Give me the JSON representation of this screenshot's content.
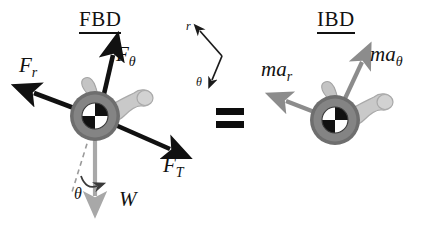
{
  "figure": {
    "type": "free-body-diagram",
    "background_color": "#ffffff",
    "width": 431,
    "height": 232,
    "equals_sign": "="
  },
  "panels": {
    "left": {
      "title": "FBD",
      "title_underlined": true,
      "body_label": "pendulum-mass-disk",
      "forces": [
        {
          "name": "F_r",
          "label": "F",
          "subscript": "r",
          "color": "#111111",
          "direction": "up-left",
          "style": "solid-black-arrow"
        },
        {
          "name": "F_theta",
          "label": "F",
          "subscript": "θ",
          "color": "#111111",
          "direction": "up",
          "style": "solid-black-arrow"
        },
        {
          "name": "F_T",
          "label": "F",
          "subscript": "T",
          "color": "#111111",
          "direction": "down-right",
          "style": "solid-black-arrow"
        },
        {
          "name": "W",
          "label": "W",
          "subscript": "",
          "color": "#a8a8a8",
          "direction": "down",
          "style": "solid-gray-arrow"
        }
      ],
      "angle": {
        "symbol": "θ",
        "reference": "dashed-line",
        "arc": "curved-arrow"
      }
    },
    "right": {
      "title": "IBD",
      "title_underlined": true,
      "body_label": "pendulum-mass-disk",
      "forces": [
        {
          "name": "ma_r",
          "label": "ma",
          "subscript": "r",
          "color": "#8c8c8c",
          "direction": "up-left",
          "style": "solid-gray-arrow"
        },
        {
          "name": "ma_theta",
          "label": "ma",
          "subscript": "θ",
          "color": "#8c8c8c",
          "direction": "up-right",
          "style": "solid-gray-arrow"
        }
      ]
    }
  },
  "coordinate_indicator": {
    "radial_label": "r",
    "tangential_label": "θ",
    "color": "#1a1a1a"
  },
  "colors": {
    "black": "#111111",
    "weight_gray": "#a8a8a8",
    "inertia_gray": "#8c8c8c",
    "disk_body": "#7d7d7d",
    "disk_rim": "#6a6a6a",
    "appendage_light": "#c9c9c9",
    "appendage_mid": "#b4b4b4",
    "white": "#ffffff"
  }
}
